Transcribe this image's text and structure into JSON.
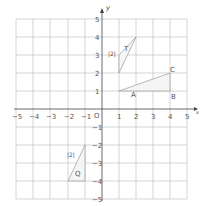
{
  "axes": {
    "x_label": "x",
    "y_label": "y",
    "origin_label": "O",
    "x_ticks": [
      "−5",
      "−4",
      "−3",
      "−2",
      "−1",
      "1",
      "2",
      "3",
      "4",
      "5"
    ],
    "y_ticks": [
      "5",
      "4",
      "3",
      "2",
      "1",
      "−1",
      "−2",
      "−3",
      "−4",
      "−5"
    ]
  },
  "shapes": {
    "T": {
      "label": "T",
      "side_label": "|2|"
    },
    "Q": {
      "label": "Q",
      "side_label": "|2|"
    },
    "triangle": {
      "A": "A",
      "B": "B",
      "C": "C"
    }
  }
}
